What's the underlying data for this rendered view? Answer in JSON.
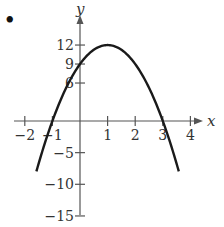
{
  "problem_marker": "•",
  "chart_data": {
    "type": "line",
    "title": "",
    "xlabel": "x",
    "ylabel": "y",
    "function": "y = -3x^2 + 6x + 9",
    "xlim": [
      -2.3,
      4.4
    ],
    "ylim": [
      -15.5,
      13.5
    ],
    "x_ticks": [
      -2,
      -1,
      1,
      2,
      3,
      4
    ],
    "x_tick_labels": [
      "−2",
      "−1",
      "1",
      "2",
      "3",
      "4"
    ],
    "y_ticks": [
      12,
      9,
      6,
      -5,
      -10,
      -15
    ],
    "y_tick_labels": [
      "12",
      "9",
      "6",
      "−5",
      "−10",
      "−15"
    ],
    "grid": false,
    "legend": null,
    "series": [
      {
        "name": "parabola",
        "x": [
          -1.55,
          -1,
          0,
          1,
          2,
          3,
          3.55
        ],
        "y": [
          -7.5,
          0,
          9,
          12,
          9,
          0,
          -7.5
        ]
      }
    ],
    "key_points": {
      "vertex": [
        1,
        12
      ],
      "y_intercept": [
        0,
        9
      ],
      "x_intercepts": [
        [
          -1,
          0
        ],
        [
          3,
          0
        ]
      ]
    },
    "style": {
      "curve_color": "#1a1a1a",
      "axis_color": "#555555"
    }
  }
}
